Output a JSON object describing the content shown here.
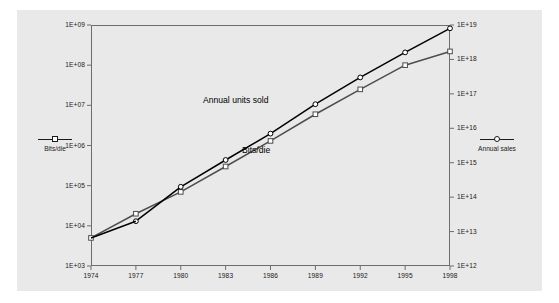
{
  "chart_data": {
    "type": "line",
    "title": "",
    "subtitle": "",
    "xlabel": "",
    "ylabel": "",
    "grid": false,
    "legend_position": "outside-left-and-right",
    "x": [
      1974,
      1977,
      1980,
      1983,
      1986,
      1989,
      1992,
      1995,
      1998
    ],
    "x_ticks": [
      "1974",
      "1977",
      "1980",
      "1983",
      "1986",
      "1989",
      "1992",
      "1995",
      "1998"
    ],
    "axes": {
      "left": {
        "label": "Bits/die",
        "scale": "log",
        "ylim": [
          1000,
          1000000000
        ],
        "ticks": [
          "1E+03",
          "1E+04",
          "1E+05",
          "1E+06",
          "1E+07",
          "1E+08",
          "1E+09"
        ],
        "tick_values": [
          1000,
          10000,
          100000,
          1000000,
          10000000,
          100000000,
          1000000000
        ]
      },
      "right": {
        "label": "Annual sales",
        "scale": "log",
        "ylim": [
          1000000000000,
          10000000000000000000
        ],
        "ticks": [
          "1E+12",
          "1E+13",
          "1E+14",
          "1E+15",
          "1E+16",
          "1E+17",
          "1E+18",
          "1E+19"
        ],
        "tick_values": [
          1000000000000.0,
          10000000000000.0,
          100000000000000.0,
          1000000000000000.0,
          1e+16,
          1e+17,
          1e+18,
          1e+19
        ]
      }
    },
    "series": [
      {
        "name": "Bits/die",
        "axis": "left",
        "marker": "square",
        "color": "#4d4d4d",
        "annotation": "Bits/die",
        "values": [
          5000,
          20000,
          70000,
          300000,
          1300000,
          6000000,
          25000000.0,
          100000000.0,
          220000000.0
        ]
      },
      {
        "name": "Annual units sold",
        "axis": "right",
        "marker": "circle",
        "color": "#000000",
        "annotation": "Annual units sold",
        "values": [
          null,
          20000000000000.0,
          200000000000000.0,
          1200000000000000.0,
          7000000000000000.0,
          5e+16,
          3e+17,
          1.6e+18,
          8e+18
        ]
      }
    ],
    "annotations": [
      {
        "text": "Annual units sold",
        "x": 1985.0,
        "y_frac": 0.4
      },
      {
        "text": "Bits/die",
        "x": 1987.5,
        "y_frac": 0.58
      }
    ]
  },
  "legends": {
    "left": {
      "label": "Bits/die",
      "marker": "square-marker"
    },
    "right": {
      "label": "Annual sales",
      "marker": "circle-marker"
    }
  },
  "colors": {
    "background": "#e9e9e9",
    "page": "#ffffff",
    "axis": "#6d6d6d",
    "series_primary": "#000000",
    "series_secondary": "#4d4d4d",
    "text": "#1a1a1a"
  }
}
